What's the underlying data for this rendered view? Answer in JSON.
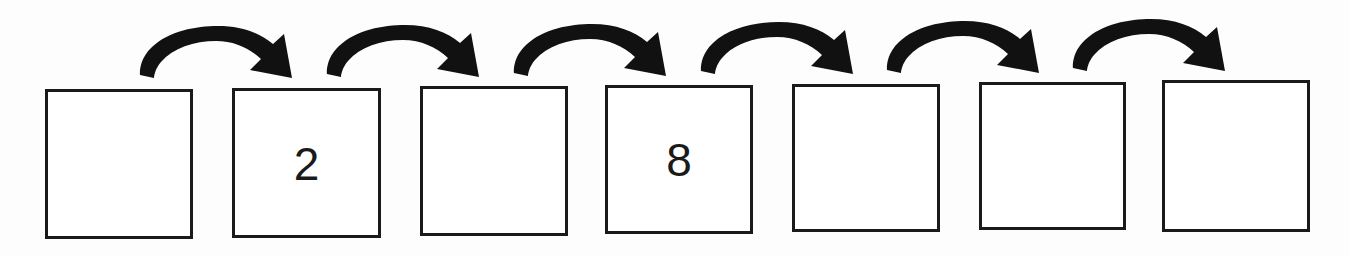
{
  "worksheet": {
    "type": "number-sequence-skip-counting",
    "background_color": "#fdfdfd",
    "ink_color": "#1a1a1a",
    "box_count": 7,
    "arrow_count": 6,
    "boxes": [
      {
        "index": 1,
        "value": "",
        "filled": false,
        "x": 45,
        "y": 89,
        "w": 148,
        "h": 150
      },
      {
        "index": 2,
        "value": "2",
        "filled": true,
        "x": 232,
        "y": 88,
        "w": 149,
        "h": 150
      },
      {
        "index": 3,
        "value": "",
        "filled": false,
        "x": 420,
        "y": 86,
        "w": 148,
        "h": 150
      },
      {
        "index": 4,
        "value": "8",
        "filled": true,
        "x": 605,
        "y": 85,
        "w": 148,
        "h": 149
      },
      {
        "index": 5,
        "value": "",
        "filled": false,
        "x": 792,
        "y": 84,
        "w": 148,
        "h": 148
      },
      {
        "index": 6,
        "value": "",
        "filled": false,
        "x": 979,
        "y": 82,
        "w": 147,
        "h": 148
      },
      {
        "index": 7,
        "value": "",
        "filled": false,
        "x": 1162,
        "y": 80,
        "w": 148,
        "h": 152
      }
    ],
    "arrows": [
      {
        "index": 1,
        "from_box": 1,
        "to_box": 2,
        "x": 136,
        "y": 26
      },
      {
        "index": 2,
        "from_box": 2,
        "to_box": 3,
        "x": 323,
        "y": 25
      },
      {
        "index": 3,
        "from_box": 3,
        "to_box": 4,
        "x": 510,
        "y": 24
      },
      {
        "index": 4,
        "from_box": 4,
        "to_box": 5,
        "x": 697,
        "y": 22
      },
      {
        "index": 5,
        "from_box": 5,
        "to_box": 6,
        "x": 883,
        "y": 21
      },
      {
        "index": 6,
        "from_box": 6,
        "to_box": 7,
        "x": 1069,
        "y": 19
      }
    ]
  }
}
